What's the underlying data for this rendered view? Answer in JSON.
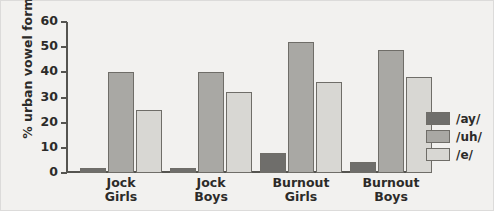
{
  "chart_data": {
    "type": "bar",
    "title": "",
    "xlabel": "",
    "ylabel": "% urban vowel forms",
    "ylim": [
      0,
      60
    ],
    "yticks": [
      0,
      10,
      20,
      30,
      40,
      50,
      60
    ],
    "ytick_labels": [
      "0",
      "10",
      "20",
      "30",
      "40",
      "50",
      "60"
    ],
    "grid": false,
    "legend_position": "right",
    "categories": [
      "Jock Girls",
      "Jock Boys",
      "Burnout Girls",
      "Burnout Boys"
    ],
    "category_lines": [
      [
        "Jock",
        "Girls"
      ],
      [
        "Jock",
        "Boys"
      ],
      [
        "Burnout",
        "Girls"
      ],
      [
        "Burnout",
        "Boys"
      ]
    ],
    "series": [
      {
        "name": "/ay/",
        "color": "#6f6e6b",
        "values": [
          2,
          2,
          8,
          4.5
        ]
      },
      {
        "name": "/uh/",
        "color": "#a9a8a4",
        "values": [
          40,
          40,
          52,
          49
        ]
      },
      {
        "name": "/e/",
        "color": "#d8d7d3",
        "values": [
          25,
          32,
          36,
          38
        ]
      }
    ]
  },
  "legend": {
    "items": [
      {
        "label": "/ay/",
        "swatch": "dark-gray-swatch"
      },
      {
        "label": "/uh/",
        "swatch": "medium-gray-swatch"
      },
      {
        "label": "/e/",
        "swatch": "light-gray-swatch"
      }
    ]
  },
  "colors": {
    "background": "#f2f1ef",
    "axis": "#555450",
    "text": "#2c2b29",
    "ay": "#6f6e6b",
    "uh": "#a9a8a4",
    "e": "#d8d7d3"
  }
}
